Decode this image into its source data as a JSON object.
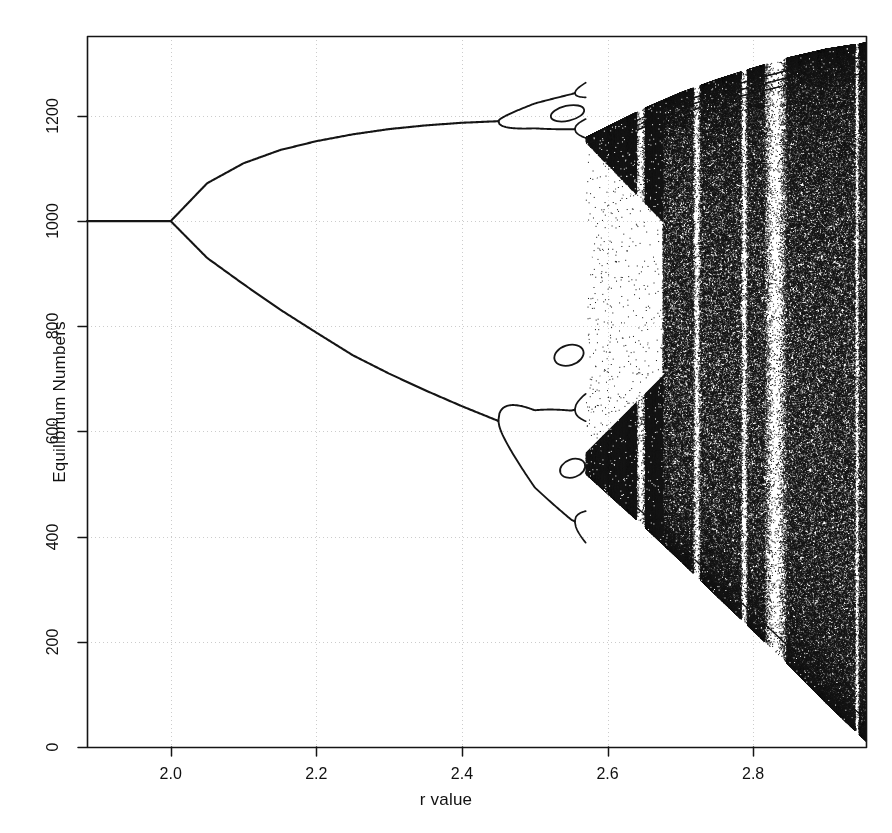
{
  "figure": {
    "title": "",
    "background_color": "#ffffff",
    "ink_color": "#151515",
    "grid_color": "#cccccc"
  },
  "axes": {
    "x": {
      "label": "r value",
      "ticks": [
        "2.0",
        "2.2",
        "2.4",
        "2.6",
        "2.8"
      ],
      "tick_values": [
        2.0,
        2.2,
        2.4,
        2.6,
        2.8
      ],
      "range": [
        1.885,
        2.955
      ]
    },
    "y": {
      "label": "Equilibrium Numbers",
      "ticks": [
        "0",
        "200",
        "400",
        "600",
        "800",
        "1000",
        "1200"
      ],
      "tick_values": [
        0,
        200,
        400,
        600,
        800,
        1000,
        1200
      ],
      "range": [
        0,
        1352
      ]
    }
  },
  "chart_data": {
    "type": "scatter",
    "title": "",
    "xlabel": "r value",
    "ylabel": "Equilibrium Numbers",
    "xlim": [
      1.885,
      2.955
    ],
    "ylim": [
      0,
      1352
    ],
    "grid": true,
    "legend": "none",
    "series": [
      {
        "name": "stable equilibrium (period 1)",
        "x": [
          1.885,
          1.95,
          2.0
        ],
        "values": [
          1000,
          1000,
          1000
        ]
      },
      {
        "name": "2-cycle upper branch",
        "x": [
          2.0,
          2.05,
          2.1,
          2.15,
          2.2,
          2.25,
          2.3,
          2.35,
          2.4,
          2.45
        ],
        "values": [
          1000,
          1072,
          1110,
          1135,
          1152,
          1165,
          1175,
          1182,
          1187,
          1190
        ]
      },
      {
        "name": "2-cycle lower branch",
        "x": [
          2.0,
          2.05,
          2.1,
          2.15,
          2.2,
          2.25,
          2.3,
          2.35,
          2.4,
          2.45
        ],
        "values": [
          1000,
          930,
          880,
          832,
          788,
          745,
          710,
          678,
          648,
          620
        ]
      },
      {
        "name": "4-cycle branches (upper pair)",
        "x": [
          2.45,
          2.5,
          2.55,
          2.57
        ],
        "values": [
          1190,
          1210,
          1222,
          1228
        ]
      },
      {
        "name": "4-cycle branches (lower pair)",
        "x": [
          2.45,
          2.5,
          2.55,
          2.57
        ],
        "values": [
          620,
          545,
          505,
          498
        ]
      },
      {
        "name": "chaotic band upper envelope",
        "x": [
          2.57,
          2.65,
          2.7,
          2.75,
          2.8,
          2.85,
          2.9,
          2.955
        ],
        "values": [
          1160,
          1215,
          1245,
          1270,
          1292,
          1312,
          1328,
          1340
        ]
      },
      {
        "name": "chaotic band lower envelope",
        "x": [
          2.57,
          2.65,
          2.7,
          2.75,
          2.8,
          2.85,
          2.9,
          2.955
        ],
        "values": [
          520,
          420,
          355,
          288,
          222,
          155,
          85,
          12
        ]
      }
    ],
    "bifurcation_points": [
      {
        "r": 2.0,
        "value": 1000,
        "type": "period-1 to period-2"
      },
      {
        "r": 2.45,
        "value": 1190,
        "type": "period-2 to period-4 (upper)"
      },
      {
        "r": 2.45,
        "value": 620,
        "type": "period-2 to period-4 (lower)"
      },
      {
        "r": 2.555,
        "value": 1228,
        "type": "period-4 to period-8 (upper)"
      },
      {
        "r": 2.555,
        "value": 500,
        "type": "period-4 to period-8 (lower)"
      },
      {
        "r": 2.57,
        "value": null,
        "type": "onset of chaos"
      }
    ],
    "periodic_windows": [
      {
        "r_center": 2.645,
        "r_width": 0.012,
        "label": "narrow window"
      },
      {
        "r_center": 2.722,
        "r_width": 0.01,
        "label": "narrow window"
      },
      {
        "r_center": 2.787,
        "r_width": 0.009,
        "label": "narrow window"
      },
      {
        "r_center": 2.83,
        "r_width": 0.03,
        "label": "wide period-3 window"
      },
      {
        "r_center": 2.942,
        "r_width": 0.006,
        "label": "narrow window"
      }
    ]
  }
}
